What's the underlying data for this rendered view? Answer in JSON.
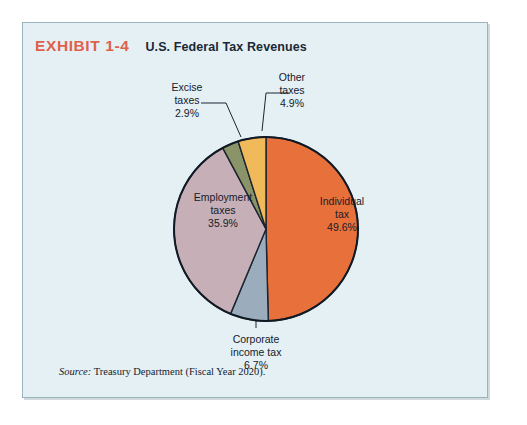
{
  "exhibit": {
    "number": "EXHIBIT 1-4",
    "title": "U.S. Federal Tax Revenues",
    "number_color": "#e0614a",
    "background_color": "#e4f0f4",
    "border_color": "#9bb3bd"
  },
  "source": {
    "label": "Source:",
    "text": "Treasury Department (Fiscal Year 2020)."
  },
  "labels": {
    "individual": {
      "name": "Individual",
      "name2": "tax",
      "value": "49.6%"
    },
    "corporate": {
      "name": "Corporate",
      "name2": "income tax",
      "value": "6.7%"
    },
    "employment": {
      "name": "Employment",
      "name2": "taxes",
      "value": "35.9%"
    },
    "excise": {
      "name": "Excise",
      "name2": "taxes",
      "value": "2.9%"
    },
    "other": {
      "name": "Other",
      "name2": "taxes",
      "value": "4.9%"
    }
  },
  "chart_data": {
    "type": "pie",
    "title": "U.S. Federal Tax Revenues",
    "subtitle": "EXHIBIT 1-4",
    "source": "Treasury Department (Fiscal Year 2020).",
    "unit": "percent of total federal tax revenues",
    "start_angle_deg": 0,
    "direction": "clockwise",
    "legend": "none (slices labeled directly)",
    "total": 100.0,
    "categories": [
      "Individual tax",
      "Corporate income tax",
      "Employment taxes",
      "Excise taxes",
      "Other taxes"
    ],
    "values": [
      49.6,
      6.7,
      35.9,
      2.9,
      4.9
    ],
    "colors": [
      "#e8703a",
      "#9badbd",
      "#c6afb6",
      "#8a9468",
      "#f0b95a"
    ],
    "slices": [
      {
        "label": "Individual tax",
        "value": 49.6,
        "color": "#e8703a",
        "label_position": "inside"
      },
      {
        "label": "Corporate income tax",
        "value": 6.7,
        "color": "#9badbd",
        "label_position": "outside-bottom"
      },
      {
        "label": "Employment taxes",
        "value": 35.9,
        "color": "#c6afb6",
        "label_position": "inside"
      },
      {
        "label": "Excise taxes",
        "value": 2.9,
        "color": "#8a9468",
        "label_position": "outside-top-left"
      },
      {
        "label": "Other taxes",
        "value": 4.9,
        "color": "#f0b95a",
        "label_position": "outside-top-right"
      }
    ]
  }
}
